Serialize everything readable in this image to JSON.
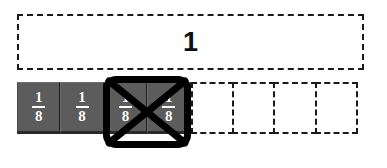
{
  "model": {
    "name": "fraction-strip-model",
    "whole": {
      "label": "1"
    },
    "total_parts": 8,
    "shaded_parts": 4,
    "unit_fraction": {
      "numerator": "1",
      "denominator": "8"
    },
    "parts": [
      {
        "state": "shaded",
        "numerator": "1",
        "denominator": "8"
      },
      {
        "state": "shaded",
        "numerator": "1",
        "denominator": "8"
      },
      {
        "state": "shaded",
        "numerator": "1",
        "denominator": "8"
      },
      {
        "state": "shaded",
        "numerator": "1",
        "denominator": "8"
      },
      {
        "state": "empty",
        "numerator": "",
        "denominator": ""
      },
      {
        "state": "empty",
        "numerator": "",
        "denominator": ""
      },
      {
        "state": "empty",
        "numerator": "",
        "denominator": ""
      },
      {
        "state": "empty",
        "numerator": "",
        "denominator": ""
      }
    ],
    "selection": {
      "name": "crossed-out-selection",
      "covers_parts": "3-4",
      "marked": "crossed-out"
    }
  },
  "colors": {
    "shaded_tile": "#5c5c5c",
    "tile_text": "#ffffff",
    "outline": "#1a1a1a",
    "selection": "#000000",
    "background": "#ffffff"
  }
}
